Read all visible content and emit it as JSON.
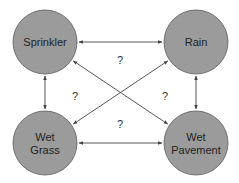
{
  "diagram": {
    "title": "",
    "colors": {
      "node_fill": "#9b9b9b",
      "node_stroke": "#5a5a5a",
      "edge": "#444444",
      "text": "#222222"
    },
    "nodes": [
      {
        "id": "sprinkler",
        "lines": [
          "Sprinkler"
        ],
        "cx": 45,
        "cy": 42,
        "r": 32
      },
      {
        "id": "rain",
        "lines": [
          "Rain"
        ],
        "cx": 196,
        "cy": 42,
        "r": 32
      },
      {
        "id": "wet-grass",
        "lines": [
          "Wet",
          "Grass"
        ],
        "cx": 45,
        "cy": 143,
        "r": 32
      },
      {
        "id": "wet-pavement",
        "lines": [
          "Wet",
          "Pavement"
        ],
        "cx": 196,
        "cy": 143,
        "r": 32
      }
    ],
    "edges": [
      {
        "from": "sprinkler",
        "to": "rain",
        "bidirectional": true
      },
      {
        "from": "sprinkler",
        "to": "wet-grass",
        "bidirectional": true
      },
      {
        "from": "rain",
        "to": "wet-pavement",
        "bidirectional": true
      },
      {
        "from": "wet-grass",
        "to": "wet-pavement",
        "bidirectional": true
      },
      {
        "from": "sprinkler",
        "to": "wet-pavement",
        "bidirectional": true
      },
      {
        "from": "rain",
        "to": "wet-grass",
        "bidirectional": true
      }
    ],
    "question_labels": [
      {
        "text": "?",
        "x": 120,
        "y": 64
      },
      {
        "text": "?",
        "x": 75,
        "y": 100
      },
      {
        "text": "?",
        "x": 165,
        "y": 100
      },
      {
        "text": "?",
        "x": 120,
        "y": 128
      }
    ]
  }
}
